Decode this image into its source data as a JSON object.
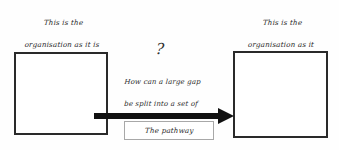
{
  "diagram": {
    "background_color": "#fefefe",
    "line_color": "#2a2a2a",
    "arrow_color": "#111111",
    "pathway_border_color": "#a8a8a8",
    "captions": {
      "current_state": {
        "line1": "This is the",
        "line2": "organisation as it is",
        "line3": "now"
      },
      "future_state": {
        "line1": "This is the",
        "line2": "organisation as it",
        "line3": "needs to be"
      }
    },
    "center": {
      "question_mark": "?",
      "question": {
        "line1": "How can a large gap",
        "line2": "be split into a set of",
        "line3": "controllable gaps?"
      }
    },
    "pathway": {
      "label": "The pathway"
    },
    "boxes": {
      "current_state_label": "",
      "future_state_label": ""
    }
  }
}
